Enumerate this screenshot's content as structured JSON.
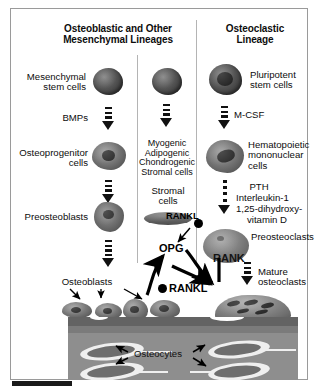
{
  "figure": {
    "background": "#ffffff",
    "frame_color": "#9a9a9a"
  },
  "headings": {
    "left_line1": "Osteoblastic and Other",
    "left_line2": "Mesenchymal Lineages",
    "right_line1": "Osteoclastic",
    "right_line2": "Lineage"
  },
  "osteoblastic": {
    "stem_line1": "Mesenchymal",
    "stem_line2": "stem cells",
    "factor_bmps": "BMPs",
    "progenitor_line1": "Osteoprogenitor",
    "progenitor_line2": "cells",
    "preosteoblasts": "Preosteoblasts",
    "osteoblasts": "Osteoblasts"
  },
  "mesenchymal_other": {
    "lineage_line1": "Myogenic",
    "lineage_line2": "Adipogenic",
    "lineage_line3": "Chondrogenic",
    "lineage_line4": "Stromal cells",
    "stromal_line1": "Stromal",
    "stromal_line2": "cells",
    "rankl_tag": "RANKL"
  },
  "osteoclastic": {
    "stem_line1": "Pluripotent",
    "stem_line2": "stem cells",
    "factor_mcsf": "M-CSF",
    "hematopoietic_line1": "Hematopoietic",
    "hematopoietic_line2": "mononuclear",
    "hematopoietic_line3": "cells",
    "factor_pth": "PTH",
    "factor_il1": "Interleukin-1",
    "factor_vitd_line1": "1,25-dihydroxy-",
    "factor_vitd_line2": "vitamin D",
    "preosteoclasts": "Preosteoclasts",
    "rank_tag": "RANK",
    "mature_line1": "Mature",
    "mature_line2": "osteoclasts"
  },
  "signaling": {
    "opg": "OPG",
    "rankl": "RANKL"
  },
  "bone": {
    "osteocytes": "Osteocytes",
    "matrix_color": "#8e8e8e",
    "surface_color": "#6a6a6a",
    "lacuna_color": "#efefef"
  }
}
